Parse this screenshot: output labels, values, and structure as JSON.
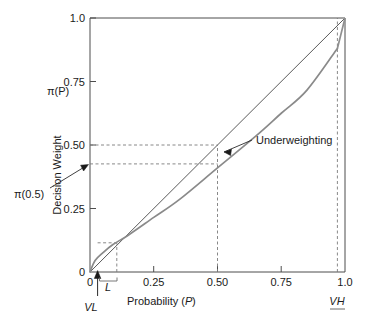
{
  "chart_data": {
    "type": "line",
    "title": "",
    "xlabel": "Probability (P)",
    "ylabel": "Decision Weight",
    "ylabel_symbol": "π(P)",
    "xlim": [
      0,
      1.0
    ],
    "ylim": [
      0,
      1.0
    ],
    "grid": false,
    "legend_position": "none",
    "x_ticks": [
      "0",
      "0.25",
      "0.50",
      "0.75",
      "1.0"
    ],
    "x_tick_values": [
      0,
      0.25,
      0.5,
      0.75,
      1.0
    ],
    "y_ticks": [
      "0",
      "0.25",
      "0.50",
      "0.75",
      "1.0"
    ],
    "y_tick_values": [
      0,
      0.25,
      0.5,
      0.75,
      1.0
    ],
    "series": [
      {
        "name": "Identity line (pi(P) = P)",
        "color": "#555555",
        "style": "solid",
        "x": [
          0,
          1.0
        ],
        "values": [
          0,
          1.0
        ]
      },
      {
        "name": "Decision weight function pi(P)",
        "color": "#8a8a8a",
        "style": "solid",
        "x": [
          0,
          0.02,
          0.05,
          0.09,
          0.15,
          0.25,
          0.35,
          0.5,
          0.65,
          0.75,
          0.85,
          0.97,
          1.0
        ],
        "values": [
          0,
          0.045,
          0.075,
          0.108,
          0.145,
          0.215,
          0.285,
          0.41,
          0.535,
          0.625,
          0.715,
          0.88,
          1.0
        ]
      }
    ],
    "reference_lines": [
      {
        "name": "pi-half-horizontal",
        "orientation": "horizontal",
        "value": 0.41,
        "style": "dashed",
        "from_x": 0,
        "to_x": 0.5
      },
      {
        "name": "half-horizontal",
        "orientation": "horizontal",
        "value": 0.5,
        "style": "dashed",
        "from_x": 0,
        "to_x": 0.5
      },
      {
        "name": "half-vertical",
        "orientation": "vertical",
        "value": 0.5,
        "style": "dashed",
        "from_y": 0,
        "to_y": 0.5
      },
      {
        "name": "vh-vertical",
        "orientation": "vertical",
        "value": 0.97,
        "style": "dashed",
        "from_y": 0,
        "to_y": 1.0
      },
      {
        "name": "l-vertical",
        "orientation": "vertical",
        "value": 0.105,
        "style": "dashed",
        "from_y": 0,
        "to_y": 0.115
      },
      {
        "name": "l-horizontal",
        "orientation": "horizontal",
        "value": 0.115,
        "style": "dashed",
        "from_x": 0.03,
        "to_x": 0.105
      }
    ],
    "annotations": [
      {
        "name": "underweighting",
        "text": "Underweighting",
        "x": 0.62,
        "y": 0.545,
        "points_to_x": 0.515,
        "points_to_y": 0.455
      },
      {
        "name": "pi-of-half",
        "text": "π(0.5)",
        "x": -0.26,
        "y": 0.28,
        "points_to_x": 0.0,
        "points_to_y": 0.41
      },
      {
        "name": "very-low",
        "text": "VL",
        "x": 0.03,
        "y": -0.16
      },
      {
        "name": "low",
        "text": "L",
        "x": 0.085,
        "y": -0.055
      },
      {
        "name": "very-high",
        "text": "VH",
        "x": 0.97,
        "y": -0.155
      }
    ],
    "origin_label": "0"
  },
  "labels": {
    "y_axis_symbol": "π(P)",
    "y_axis_name": "Decision Weight",
    "x_axis_name": "Probability (",
    "x_axis_var": "P",
    "x_axis_close": ")",
    "pi_half": "π(0.5)",
    "underweighting": "Underweighting",
    "very_low": "VL",
    "low": "L",
    "very_high": "VH",
    "origin": "0",
    "y_tick_025": "0.25",
    "y_tick_050": "0.50",
    "y_tick_075": "0.75",
    "y_tick_100": "1.0",
    "x_tick_000": "0",
    "x_tick_025": "0.25",
    "x_tick_050": "0.50",
    "x_tick_075": "0.75",
    "x_tick_100": "1.0"
  },
  "colors": {
    "axis": "#4d4d4d",
    "identity_line": "#5a5a5a",
    "weight_curve": "#8f8f8f",
    "dashed": "#7a7a7a",
    "text": "#1a1a1a",
    "background": "#ffffff"
  }
}
